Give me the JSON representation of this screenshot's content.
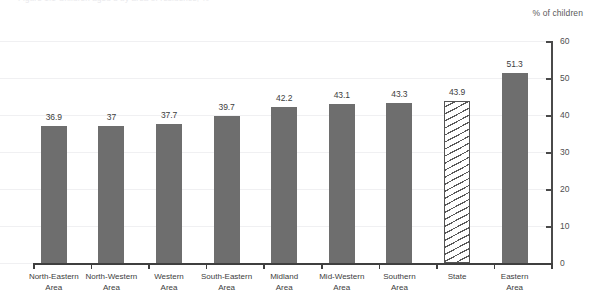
{
  "header": {
    "ghost_text": "Figure 1.1  Children aged 3 by area of residence, %"
  },
  "unit_caption": "% of children",
  "chart_data": {
    "type": "bar",
    "title": "",
    "subtitle": "",
    "xlabel": "",
    "ylabel": "% of children",
    "ylim": [
      0,
      60
    ],
    "ytick_step": 10,
    "yticks": [
      0,
      10,
      20,
      30,
      40,
      50,
      60
    ],
    "ytick_labels": [
      "0",
      "10",
      "20",
      "30",
      "40",
      "50",
      "60"
    ],
    "grid": true,
    "grid_axis": "y",
    "legend": false,
    "legend_position": "none",
    "axis_position": "right",
    "categories": [
      "North-Eastern\nArea",
      "North-Western\nArea",
      "Western\nArea",
      "South-Eastern\nArea",
      "Midland\nArea",
      "Mid-Western\nArea",
      "Southern\nArea",
      "State",
      "Eastern\nArea"
    ],
    "values": [
      36.9,
      37,
      37.7,
      39.7,
      42.2,
      43.1,
      43.3,
      43.9,
      51.3
    ],
    "value_labels": [
      "36.9",
      "37",
      "37.7",
      "39.7",
      "42.2",
      "43.1",
      "43.3",
      "43.9",
      "51.3"
    ],
    "bar_styles": [
      "solid",
      "solid",
      "solid",
      "solid",
      "solid",
      "solid",
      "solid",
      "hatched",
      "solid"
    ],
    "colors": {
      "bar_fill": "#6e6e6e",
      "hatch_line": "#5a5a5a",
      "hatch_background": "#ffffff",
      "gridline": "#f0f0f2",
      "axis": "#3f3f3f",
      "label_text": "#3d3d3d",
      "background": "#ffffff"
    }
  }
}
